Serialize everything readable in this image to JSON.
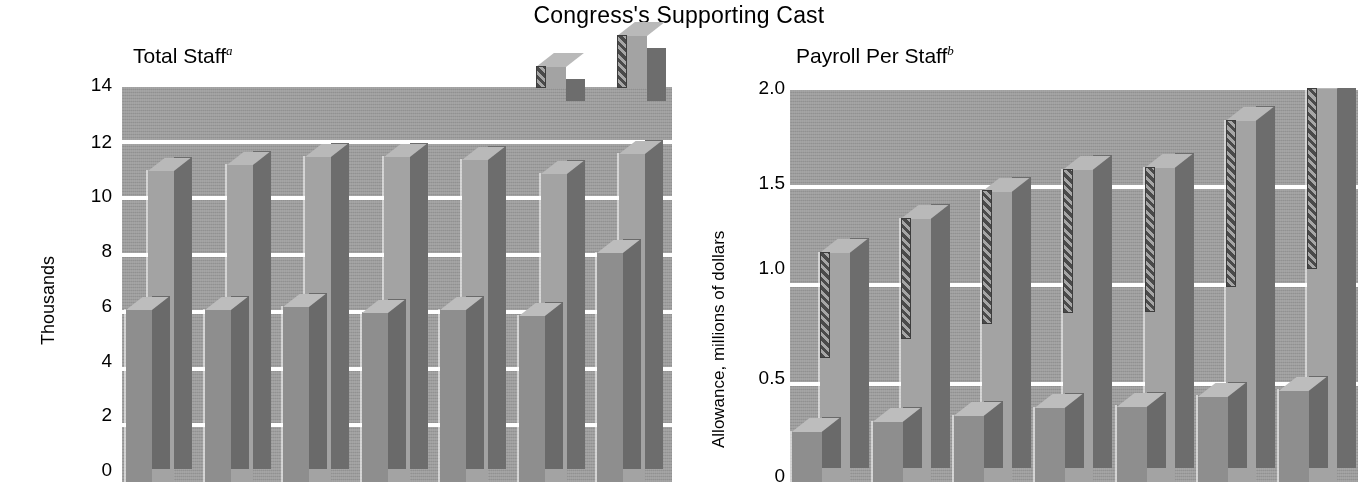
{
  "title": "Congress's Supporting Cast",
  "panels": {
    "left": {
      "title": "Total Staff",
      "title_sup": "a",
      "ylabel": "Thousands",
      "ticks": [
        "14",
        "12",
        "10",
        "8",
        "6",
        "4",
        "2",
        "0"
      ]
    },
    "right": {
      "title": "Payroll Per Staff",
      "title_sup": "b",
      "ylabel": "Allowance, millions of dollars",
      "ticks": [
        "2.0",
        "1.5",
        "1.0",
        "0.5",
        "0"
      ]
    }
  },
  "chart_data": [
    {
      "type": "bar",
      "title": "Total Staff",
      "xlabel": "",
      "ylabel": "Thousands",
      "ylim": [
        0,
        14
      ],
      "yticks": [
        0,
        2,
        4,
        6,
        8,
        10,
        12,
        14
      ],
      "grid": true,
      "categories": [
        "1",
        "2",
        "3",
        "4",
        "5",
        "6",
        "7"
      ],
      "series": [
        {
          "name": "Tall bar",
          "values": [
            11.0,
            11.2,
            11.5,
            11.5,
            11.4,
            10.9,
            11.6
          ]
        },
        {
          "name": "Short bar",
          "values": [
            6.1,
            6.1,
            6.2,
            6.0,
            6.1,
            5.9,
            8.1
          ]
        }
      ]
    },
    {
      "type": "bar",
      "title": "Payroll Per Staff",
      "xlabel": "",
      "ylabel": "Allowance, millions of dollars",
      "ylim": [
        0,
        2.0
      ],
      "yticks": [
        0,
        0.5,
        1.0,
        1.5,
        2.0
      ],
      "grid": true,
      "categories": [
        "1",
        "2",
        "3",
        "4",
        "5",
        "6",
        "7"
      ],
      "series": [
        {
          "name": "Tall bar",
          "values": [
            1.17,
            1.34,
            1.48,
            1.59,
            1.6,
            1.84,
            2.0
          ]
        },
        {
          "name": "Short bar",
          "values": [
            0.26,
            0.31,
            0.34,
            0.38,
            0.39,
            0.44,
            0.47
          ]
        }
      ]
    }
  ]
}
